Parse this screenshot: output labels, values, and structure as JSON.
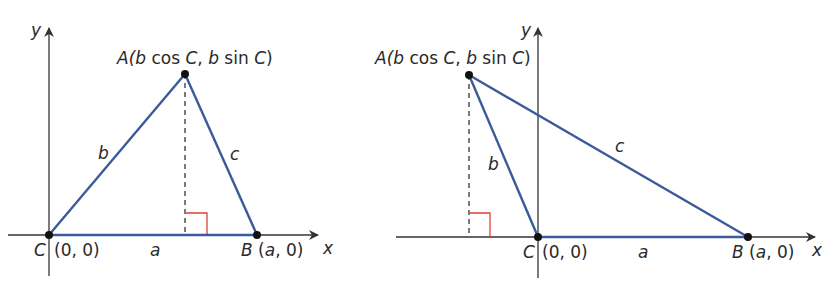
{
  "colors": {
    "side": "#3b5a9a",
    "axis": "#333333",
    "right_angle": "#e0403a",
    "point": "#111111",
    "dashed": "#222222"
  },
  "figures": [
    {
      "id": "acute",
      "axis_x_label": "x",
      "axis_y_label": "y",
      "vertex_A": {
        "name": "A",
        "coords": "(b cos C, b sin C)",
        "name_part": "A(",
        "b1": "b",
        "cos": " cos ",
        "C1": "C",
        "comma": ", ",
        "b2": "b",
        "sin": " sin ",
        "C2": "C",
        "close": ")"
      },
      "vertex_B": {
        "name": "B",
        "coords": "(a, 0)",
        "a": "a",
        "rest": ", 0)",
        "open": " ("
      },
      "vertex_C": {
        "name": "C",
        "coords": "(0, 0)"
      },
      "side_a": "a",
      "side_b": "b",
      "side_c": "c"
    },
    {
      "id": "obtuse",
      "axis_x_label": "x",
      "axis_y_label": "y",
      "vertex_A": {
        "name": "A",
        "coords": "(b cos C, b sin C)",
        "name_part": "A(",
        "b1": "b",
        "cos": " cos ",
        "C1": "C",
        "comma": ", ",
        "b2": "b",
        "sin": " sin ",
        "C2": "C",
        "close": ")"
      },
      "vertex_B": {
        "name": "B",
        "coords": "(a, 0)",
        "a": "a",
        "rest": ", 0)",
        "open": " ("
      },
      "vertex_C": {
        "name": "C",
        "coords": "(0, 0)"
      },
      "side_a": "a",
      "side_b": "b",
      "side_c": "c"
    }
  ]
}
